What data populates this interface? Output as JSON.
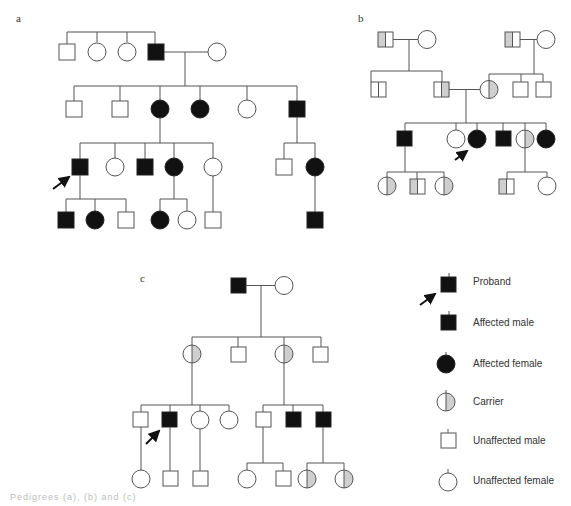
{
  "panels": {
    "a": {
      "label": "a"
    },
    "b": {
      "label": "b"
    },
    "c": {
      "label": "c"
    }
  },
  "legend": {
    "items": [
      {
        "symbol": "proband-affected-male-with-arrow",
        "label": "Proband"
      },
      {
        "symbol": "filled-square",
        "label": "Affected male"
      },
      {
        "symbol": "filled-circle",
        "label": "Affected female"
      },
      {
        "symbol": "half-shaded-circle",
        "label": "Carrier"
      },
      {
        "symbol": "open-square",
        "label": "Unaffected male"
      },
      {
        "symbol": "open-circle",
        "label": "Unaffected female"
      }
    ]
  },
  "colors": {
    "affected": "#111111",
    "carrier_shade": "#cfcfcf",
    "line": "#555555"
  },
  "pedigrees": {
    "a": {
      "generations": [
        [
          "unaffected male",
          "unaffected female",
          "unaffected female",
          "affected male",
          "unaffected female (spouse)"
        ],
        [
          "unaffected male",
          "unaffected male",
          "affected female",
          "affected female",
          "unaffected female",
          "affected male"
        ],
        [
          "affected male (proband)",
          "unaffected female",
          "affected male",
          "affected female",
          "unaffected female",
          "unaffected male",
          "affected female"
        ],
        [
          "affected male",
          "affected female",
          "unaffected male",
          "affected female",
          "unaffected female",
          "unaffected male",
          "affected male"
        ]
      ]
    },
    "b": {
      "generations": [
        [
          "carrier male",
          "unaffected female",
          "carrier male",
          "unaffected female"
        ],
        [
          "carrier male",
          "carrier male",
          "carrier female",
          "unaffected male",
          "unaffected male"
        ],
        [
          "affected male",
          "unaffected female",
          "affected female (proband)",
          "affected male",
          "carrier female",
          "affected female"
        ],
        [
          "carrier female",
          "carrier male",
          "carrier female",
          "carrier male",
          "unaffected female"
        ]
      ]
    },
    "c": {
      "generations": [
        [
          "affected male",
          "unaffected female"
        ],
        [
          "carrier female",
          "unaffected male",
          "carrier female",
          "unaffected male"
        ],
        [
          "unaffected male",
          "affected male (proband)",
          "unaffected female",
          "unaffected female",
          "unaffected male",
          "affected male",
          "affected male"
        ],
        [
          "unaffected female",
          "unaffected male",
          "unaffected male",
          "unaffected female",
          "unaffected male",
          "carrier female",
          "carrier female"
        ]
      ]
    }
  },
  "caption": "Pedigrees (a), (b) and (c)"
}
